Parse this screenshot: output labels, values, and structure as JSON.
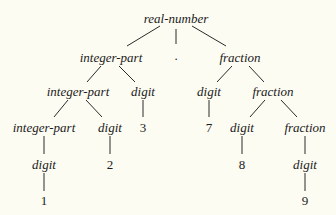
{
  "diagram": {
    "type": "parse-tree",
    "background": "#fdfcf3",
    "line_color": "#2a2a2a",
    "nodes": [
      {
        "id": "n0",
        "label": "real-number",
        "kind": "nonterminal",
        "x": 176,
        "y": 18
      },
      {
        "id": "n1",
        "label": "integer-part",
        "kind": "nonterminal",
        "x": 111,
        "y": 57
      },
      {
        "id": "n2",
        "label": ".",
        "kind": "terminal",
        "x": 176,
        "y": 55
      },
      {
        "id": "n3",
        "label": "fraction",
        "kind": "nonterminal",
        "x": 240,
        "y": 57
      },
      {
        "id": "n4",
        "label": "integer-part",
        "kind": "nonterminal",
        "x": 78,
        "y": 91
      },
      {
        "id": "n5",
        "label": "digit",
        "kind": "nonterminal",
        "x": 143,
        "y": 91
      },
      {
        "id": "n6",
        "label": "digit",
        "kind": "nonterminal",
        "x": 209,
        "y": 91
      },
      {
        "id": "n7",
        "label": "fraction",
        "kind": "nonterminal",
        "x": 273,
        "y": 91
      },
      {
        "id": "n8",
        "label": "integer-part",
        "kind": "nonterminal",
        "x": 44,
        "y": 127
      },
      {
        "id": "n9",
        "label": "digit",
        "kind": "nonterminal",
        "x": 110,
        "y": 127
      },
      {
        "id": "n10",
        "label": "3",
        "kind": "terminal",
        "x": 143,
        "y": 127
      },
      {
        "id": "n11",
        "label": "7",
        "kind": "terminal",
        "x": 209,
        "y": 127
      },
      {
        "id": "n12",
        "label": "digit",
        "kind": "nonterminal",
        "x": 242,
        "y": 127
      },
      {
        "id": "n13",
        "label": "fraction",
        "kind": "nonterminal",
        "x": 305,
        "y": 127
      },
      {
        "id": "n14",
        "label": "digit",
        "kind": "nonterminal",
        "x": 44,
        "y": 164
      },
      {
        "id": "n15",
        "label": "2",
        "kind": "terminal",
        "x": 110,
        "y": 164
      },
      {
        "id": "n16",
        "label": "8",
        "kind": "terminal",
        "x": 242,
        "y": 164
      },
      {
        "id": "n17",
        "label": "digit",
        "kind": "nonterminal",
        "x": 305,
        "y": 164
      },
      {
        "id": "n18",
        "label": "1",
        "kind": "terminal",
        "x": 44,
        "y": 200
      },
      {
        "id": "n19",
        "label": "9",
        "kind": "terminal",
        "x": 305,
        "y": 200
      }
    ],
    "edges": [
      {
        "x1": 160,
        "y1": 26,
        "x2": 127,
        "y2": 46
      },
      {
        "x1": 176,
        "y1": 29,
        "x2": 176,
        "y2": 44
      },
      {
        "x1": 192,
        "y1": 26,
        "x2": 226,
        "y2": 46
      },
      {
        "x1": 101,
        "y1": 66,
        "x2": 87,
        "y2": 82
      },
      {
        "x1": 119,
        "y1": 66,
        "x2": 135,
        "y2": 82
      },
      {
        "x1": 232,
        "y1": 66,
        "x2": 217,
        "y2": 82
      },
      {
        "x1": 249,
        "y1": 66,
        "x2": 264,
        "y2": 82
      },
      {
        "x1": 68,
        "y1": 100,
        "x2": 54,
        "y2": 117
      },
      {
        "x1": 86,
        "y1": 100,
        "x2": 102,
        "y2": 117
      },
      {
        "x1": 143,
        "y1": 100,
        "x2": 143,
        "y2": 117
      },
      {
        "x1": 209,
        "y1": 100,
        "x2": 209,
        "y2": 117
      },
      {
        "x1": 265,
        "y1": 100,
        "x2": 250,
        "y2": 117
      },
      {
        "x1": 281,
        "y1": 100,
        "x2": 297,
        "y2": 117
      },
      {
        "x1": 44,
        "y1": 136,
        "x2": 44,
        "y2": 154
      },
      {
        "x1": 110,
        "y1": 136,
        "x2": 110,
        "y2": 154
      },
      {
        "x1": 242,
        "y1": 136,
        "x2": 242,
        "y2": 154
      },
      {
        "x1": 305,
        "y1": 136,
        "x2": 305,
        "y2": 154
      },
      {
        "x1": 44,
        "y1": 173,
        "x2": 44,
        "y2": 191
      },
      {
        "x1": 305,
        "y1": 173,
        "x2": 305,
        "y2": 191
      }
    ]
  }
}
